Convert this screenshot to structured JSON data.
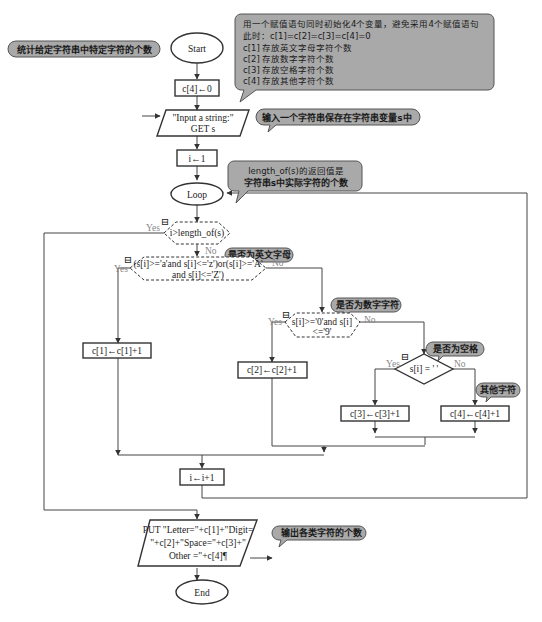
{
  "title_bubble": "统计给定字符串中特定字符的个数",
  "nodes": {
    "start": "Start",
    "init": "c[4]←0",
    "input_line1": "\"Input a string:\"",
    "input_line2": "GET s",
    "assign_i": "i←1",
    "loop": "Loop",
    "cond_length": "i>length_of(s)",
    "cond_letter_line1": "(s[i]>='a'and s[i]<='z')or(s[i]>='A'",
    "cond_letter_line2": "and s[i]<='Z')",
    "inc_c1": "c[1]←c[1]+1",
    "cond_digit_line1": "s[i]>='0'and s[i]",
    "cond_digit_line2": "<='9'",
    "inc_c2": "c[2]←c[2]+1",
    "cond_space": "s[i] = ' '",
    "inc_c3": "c[3]←c[3]+1",
    "inc_c4": "c[4]←c[4]+1",
    "inc_i": "i←i+1",
    "output_line1": "PUT \"Letter=\"+c[1]+\"Digit=",
    "output_line2": "\"+c[2]+\"Space=\"+c[3]+\"",
    "output_line3": "Other =\"+c[4]¶",
    "end": "End"
  },
  "branch_labels": {
    "yes": "Yes",
    "no": "No"
  },
  "comments": {
    "init_note": [
      "用一个赋值语句同时初始化4个变量，避免采用4个赋值语句",
      "此时：c[1]=c[2]=c[3]=c[4]=0",
      "c[1] 存放英文字母字符个数",
      "c[2] 存放数字字符个数",
      "c[3] 存放空格字符个数",
      "c[4] 存放其他字符个数"
    ],
    "input_note": "输入一个字符串保存在字符串变量s中",
    "length_note": [
      "length_of(s)的返回值是",
      "字符串s中实际字符的个数"
    ],
    "letter_note": "是否为英文字母",
    "digit_note": "是否为数字字符",
    "space_note": "是否为空格",
    "other_note": "其他字符",
    "output_note": "输出各类字符的个数"
  },
  "icons": {
    "collapse": "⊟"
  },
  "colors": {
    "bubble_fill": "#a9a9a9",
    "line": "#444444",
    "label_gray": "#888888"
  }
}
